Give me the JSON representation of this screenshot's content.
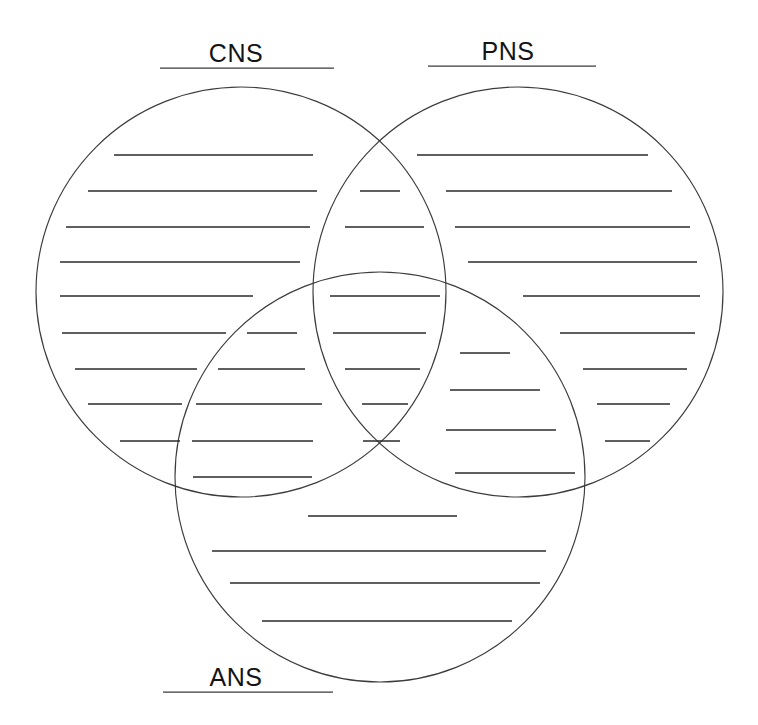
{
  "worksheet": {
    "title": "Nervous System Venn Diagram Worksheet",
    "type": "three-circle-venn",
    "background_color": "#ffffff",
    "line_color": "#2a2a2a",
    "circle_stroke_color": "#3c3c3c"
  },
  "labels": {
    "cns": "CNS",
    "pns": "PNS",
    "ans": "ANS"
  },
  "label_positions": {
    "cns": {
      "text_x": 236,
      "text_y": 62,
      "rule_x1": 160,
      "rule_x2": 334,
      "rule_y": 68
    },
    "pns": {
      "text_x": 508,
      "text_y": 60,
      "rule_x1": 428,
      "rule_x2": 596,
      "rule_y": 66
    },
    "ans": {
      "text_x": 236,
      "text_y": 686,
      "rule_x1": 163,
      "rule_x2": 333,
      "rule_y": 692
    }
  },
  "circles": [
    {
      "name": "cns-circle",
      "label": "CNS",
      "cx": 241,
      "cy": 292,
      "r": 205
    },
    {
      "name": "pns-circle",
      "label": "PNS",
      "cx": 518,
      "cy": 292,
      "r": 205
    },
    {
      "name": "ans-circle",
      "label": "ANS",
      "cx": 380,
      "cy": 477,
      "r": 205
    }
  ],
  "regions": {
    "cns_only": {
      "name": "CNS only",
      "lines": [
        {
          "x1": 114,
          "x2": 313,
          "y": 155
        },
        {
          "x1": 88,
          "x2": 317,
          "y": 191
        },
        {
          "x1": 66,
          "x2": 310,
          "y": 227
        },
        {
          "x1": 60,
          "x2": 300,
          "y": 262
        },
        {
          "x1": 60,
          "x2": 253,
          "y": 296
        },
        {
          "x1": 62,
          "x2": 226,
          "y": 333
        },
        {
          "x1": 75,
          "x2": 197,
          "y": 369
        },
        {
          "x1": 88,
          "x2": 182,
          "y": 404
        },
        {
          "x1": 120,
          "x2": 180,
          "y": 441
        }
      ]
    },
    "cns_ans_only": {
      "name": "CNS and ANS overlap",
      "lines": [
        {
          "x1": 247,
          "x2": 297,
          "y": 333
        },
        {
          "x1": 218,
          "x2": 305,
          "y": 369
        },
        {
          "x1": 196,
          "x2": 322,
          "y": 404
        },
        {
          "x1": 192,
          "x2": 313,
          "y": 441
        },
        {
          "x1": 193,
          "x2": 312,
          "y": 477
        }
      ]
    },
    "cns_pns_only": {
      "name": "CNS and PNS overlap",
      "lines": [
        {
          "x1": 360,
          "x2": 400,
          "y": 191
        },
        {
          "x1": 345,
          "x2": 424,
          "y": 227
        }
      ]
    },
    "center_all_three": {
      "name": "CNS, PNS and ANS overlap",
      "lines": [
        {
          "x1": 330,
          "x2": 440,
          "y": 296
        },
        {
          "x1": 333,
          "x2": 426,
          "y": 333
        },
        {
          "x1": 345,
          "x2": 420,
          "y": 369
        },
        {
          "x1": 362,
          "x2": 408,
          "y": 404
        },
        {
          "x1": 363,
          "x2": 400,
          "y": 441
        }
      ]
    },
    "pns_ans_only": {
      "name": "PNS and ANS overlap",
      "lines": [
        {
          "x1": 460,
          "x2": 510,
          "y": 353
        },
        {
          "x1": 450,
          "x2": 540,
          "y": 390
        },
        {
          "x1": 446,
          "x2": 556,
          "y": 430
        },
        {
          "x1": 455,
          "x2": 575,
          "y": 473
        }
      ]
    },
    "pns_only": {
      "name": "PNS only",
      "lines": [
        {
          "x1": 417,
          "x2": 648,
          "y": 155
        },
        {
          "x1": 446,
          "x2": 672,
          "y": 191
        },
        {
          "x1": 455,
          "x2": 690,
          "y": 227
        },
        {
          "x1": 468,
          "x2": 697,
          "y": 262
        },
        {
          "x1": 523,
          "x2": 700,
          "y": 296
        },
        {
          "x1": 560,
          "x2": 695,
          "y": 333
        },
        {
          "x1": 583,
          "x2": 687,
          "y": 369
        },
        {
          "x1": 597,
          "x2": 670,
          "y": 404
        },
        {
          "x1": 605,
          "x2": 650,
          "y": 441
        }
      ]
    },
    "ans_only": {
      "name": "ANS only",
      "lines": [
        {
          "x1": 308,
          "x2": 457,
          "y": 516
        },
        {
          "x1": 212,
          "x2": 546,
          "y": 551
        },
        {
          "x1": 230,
          "x2": 540,
          "y": 583
        },
        {
          "x1": 262,
          "x2": 512,
          "y": 621
        }
      ]
    }
  }
}
